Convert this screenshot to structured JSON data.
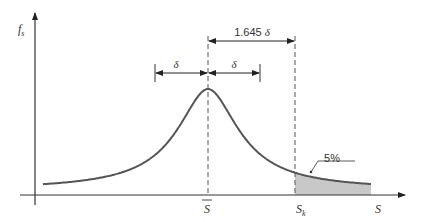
{
  "diagram": {
    "y_axis_label": "f",
    "y_axis_label_sub": "s",
    "x_axis_label": "S",
    "mean_label": "S",
    "characteristic_label": "S",
    "characteristic_label_sub": "k",
    "delta_left_label": "δ",
    "delta_right_label": "δ",
    "offset_label_value": "1.645",
    "offset_label_symbol": "δ",
    "tail_area_label": "5%",
    "colors": {
      "curve": "#555555",
      "axis": "#333333",
      "dashed": "#555555",
      "tail_fill": "#c8c8c8"
    }
  }
}
